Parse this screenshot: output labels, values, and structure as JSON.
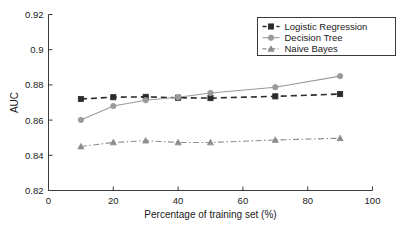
{
  "chart_data": {
    "type": "line",
    "title": "",
    "xlabel": "Percentage of training set (%)",
    "ylabel": "AUC",
    "xlim": [
      0,
      100
    ],
    "ylim": [
      0.82,
      0.92
    ],
    "xticks": [
      "0",
      "20",
      "40",
      "60",
      "80",
      "100"
    ],
    "xtick_values": [
      0,
      20,
      40,
      60,
      80,
      100
    ],
    "yticks": [
      "0.82",
      "0.84",
      "0.86",
      "0.88",
      "0.9",
      "0.92"
    ],
    "ytick_values": [
      0.82,
      0.84,
      0.86,
      0.88,
      0.9,
      0.92
    ],
    "grid": false,
    "legend_position": "upper right",
    "x": [
      10,
      20,
      30,
      40,
      50,
      70,
      90
    ],
    "series": [
      {
        "name": "Logistic Regression",
        "values": [
          0.872,
          0.873,
          0.8732,
          0.8727,
          0.8725,
          0.8735,
          0.8748
        ],
        "color": "#2b2b2b",
        "marker": "square",
        "linestyle": "dashed"
      },
      {
        "name": "Decision Tree",
        "values": [
          0.8601,
          0.868,
          0.8713,
          0.873,
          0.8754,
          0.8787,
          0.885
        ],
        "color": "#9a9a9a",
        "marker": "circle",
        "linestyle": "solid"
      },
      {
        "name": "Naive Bayes",
        "values": [
          0.845,
          0.8473,
          0.8483,
          0.8473,
          0.8473,
          0.8487,
          0.8497
        ],
        "color": "#8c8c8c",
        "marker": "triangle",
        "linestyle": "dashdot"
      }
    ]
  },
  "legend": {
    "entries": [
      {
        "label": "Logistic Regression"
      },
      {
        "label": "Decision Tree"
      },
      {
        "label": "Naive Bayes"
      }
    ]
  },
  "colors": {
    "axis": "#3a3a3a",
    "text": "#1a1a1a",
    "background": "#ffffff",
    "logistic_regression": "#2b2b2b",
    "decision_tree": "#9a9a9a",
    "naive_bayes": "#8c8c8c"
  }
}
